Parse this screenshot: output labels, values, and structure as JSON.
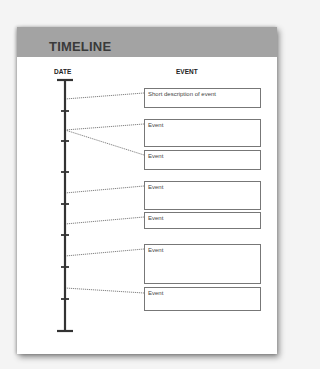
{
  "header": {
    "title": "TIMELINE"
  },
  "columns": {
    "date": "DATE",
    "event": "EVENT"
  },
  "colors": {
    "header_bg": "#a3a3a3",
    "axis": "#333333",
    "box_border": "#777777"
  },
  "axis": {
    "x": 65,
    "top": 80,
    "bottom": 331,
    "ticks_y": [
      111,
      141,
      172,
      204,
      235,
      267,
      299
    ]
  },
  "events": [
    {
      "label": "Short description of event",
      "top": 88,
      "height": 20,
      "from_y": 99,
      "to_y": 93
    },
    {
      "label": "Event",
      "top": 119,
      "height": 28,
      "from_y": 130,
      "to_y": 124
    },
    {
      "label": "Event",
      "top": 150,
      "height": 20,
      "from_y": 130,
      "to_y": 155
    },
    {
      "label": "Event",
      "top": 181,
      "height": 29,
      "from_y": 193,
      "to_y": 186
    },
    {
      "label": "Event",
      "top": 212,
      "height": 17,
      "from_y": 224,
      "to_y": 217
    },
    {
      "label": "Event",
      "top": 244,
      "height": 40,
      "from_y": 256,
      "to_y": 249
    },
    {
      "label": "Event",
      "top": 287,
      "height": 24,
      "from_y": 288,
      "to_y": 293
    }
  ]
}
